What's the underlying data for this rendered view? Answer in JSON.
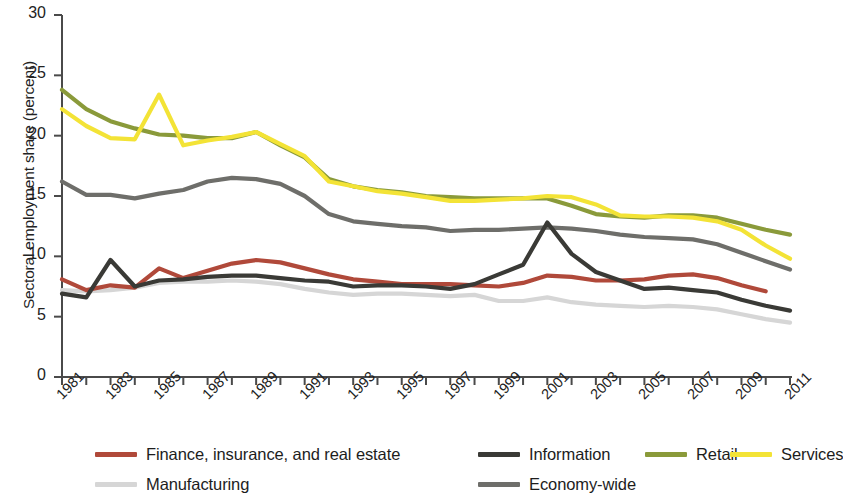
{
  "chart_data": {
    "type": "line",
    "title": "",
    "xlabel": "",
    "ylabel": "Sectoral employment share (percent)",
    "xlim": [
      1981,
      2011
    ],
    "ylim": [
      0,
      30
    ],
    "yticks": [
      0,
      5,
      10,
      15,
      20,
      25,
      30
    ],
    "ytick_labels": [
      "0",
      "5",
      "10",
      "15",
      "20",
      "25",
      "30"
    ],
    "x": [
      1981,
      1982,
      1983,
      1984,
      1985,
      1986,
      1987,
      1988,
      1989,
      1990,
      1991,
      1992,
      1993,
      1994,
      1995,
      1996,
      1997,
      1998,
      1999,
      2000,
      2001,
      2002,
      2003,
      2004,
      2005,
      2006,
      2007,
      2008,
      2009,
      2010,
      2011
    ],
    "xtick_labels": [
      "1981",
      "1983",
      "1985",
      "1987",
      "1989",
      "1991",
      "1993",
      "1995",
      "1997",
      "1999",
      "2001",
      "2003",
      "2005",
      "2007",
      "2009",
      "2011"
    ],
    "grid": false,
    "legend_position": "bottom",
    "series": [
      {
        "name": "Finance, insurance, and real estate",
        "color": "#b0493a",
        "values": [
          8.1,
          7.2,
          7.6,
          7.4,
          9.0,
          8.2,
          8.8,
          9.4,
          9.7,
          9.5,
          9.0,
          8.5,
          8.1,
          7.9,
          7.7,
          7.7,
          7.7,
          7.6,
          7.5,
          7.8,
          8.4,
          8.3,
          8.0,
          8.0,
          8.1,
          8.4,
          8.5,
          8.2,
          7.6,
          7.1,
          null
        ]
      },
      {
        "name": "Information",
        "color": "#3a3a36",
        "values": [
          6.9,
          6.6,
          9.7,
          7.5,
          8.0,
          8.1,
          8.3,
          8.4,
          8.4,
          8.2,
          8.0,
          7.9,
          7.5,
          7.6,
          7.6,
          7.5,
          7.3,
          7.7,
          8.5,
          9.3,
          12.8,
          10.2,
          8.7,
          8.0,
          7.3,
          7.4,
          7.2,
          7.0,
          6.4,
          5.9,
          5.5
        ]
      },
      {
        "name": "Retail",
        "color": "#8a9a3a",
        "values": [
          23.8,
          22.2,
          21.2,
          20.6,
          20.1,
          20.0,
          19.8,
          19.8,
          20.3,
          19.2,
          18.2,
          16.4,
          15.8,
          15.5,
          15.3,
          15.0,
          14.9,
          14.8,
          14.8,
          14.8,
          14.8,
          14.2,
          13.5,
          13.3,
          13.2,
          13.4,
          13.4,
          13.2,
          12.7,
          12.2,
          11.8
        ]
      },
      {
        "name": "Services",
        "color": "#f3e336",
        "values": [
          22.2,
          20.8,
          19.8,
          19.7,
          23.4,
          19.2,
          19.6,
          19.9,
          20.3,
          19.3,
          18.3,
          16.2,
          15.8,
          15.4,
          15.2,
          14.9,
          14.6,
          14.6,
          14.7,
          14.8,
          15.0,
          14.9,
          14.3,
          13.4,
          13.3,
          13.3,
          13.2,
          12.9,
          12.2,
          10.9,
          9.8
        ]
      },
      {
        "name": "Manufacturing",
        "color": "#d6d6d6",
        "values": [
          7.2,
          7.1,
          7.2,
          7.4,
          7.8,
          7.9,
          7.9,
          8.0,
          7.9,
          7.7,
          7.3,
          7.0,
          6.8,
          6.9,
          6.9,
          6.8,
          6.7,
          6.8,
          6.3,
          6.3,
          6.6,
          6.2,
          6.0,
          5.9,
          5.8,
          5.9,
          5.8,
          5.6,
          5.2,
          4.8,
          4.5
        ]
      },
      {
        "name": "Economy-wide",
        "color": "#6e6e6a",
        "values": [
          16.2,
          15.1,
          15.1,
          14.8,
          15.2,
          15.5,
          16.2,
          16.5,
          16.4,
          16.0,
          15.0,
          13.5,
          12.9,
          12.7,
          12.5,
          12.4,
          12.1,
          12.2,
          12.2,
          12.3,
          12.4,
          12.3,
          12.1,
          11.8,
          11.6,
          11.5,
          11.4,
          11.0,
          10.3,
          9.6,
          8.9
        ]
      }
    ]
  },
  "legend": {
    "items": [
      {
        "label": "Finance, insurance, and real estate",
        "color": "#b0493a",
        "row": 0,
        "col": 0
      },
      {
        "label": "Information",
        "color": "#3a3a36",
        "row": 0,
        "col": 1
      },
      {
        "label": "Retail",
        "color": "#8a9a3a",
        "row": 0,
        "col": 2
      },
      {
        "label": "Services",
        "color": "#f3e336",
        "row": 0,
        "col": 3
      },
      {
        "label": "Manufacturing",
        "color": "#d6d6d6",
        "row": 1,
        "col": 0
      },
      {
        "label": "Economy-wide",
        "color": "#6e6e6a",
        "row": 1,
        "col": 1
      }
    ]
  }
}
